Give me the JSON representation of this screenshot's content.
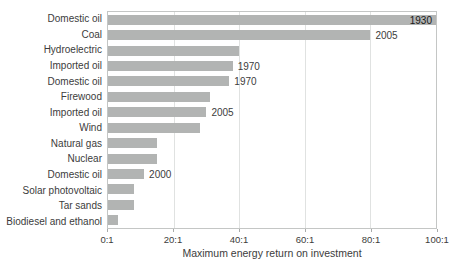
{
  "chart_data": {
    "type": "bar",
    "orientation": "horizontal",
    "title": "",
    "xlabel": "Maximum energy return on investment",
    "ylabel": "",
    "xlim": [
      0,
      100
    ],
    "grid": "vertical",
    "x_ticks": [
      "0:1",
      "20:1",
      "40:1",
      "60:1",
      "80:1",
      "100:1"
    ],
    "x_tick_values": [
      0,
      20,
      40,
      60,
      80,
      100
    ],
    "bars": [
      {
        "label": "Domestic oil",
        "value": 100,
        "year": "1930",
        "year_position": "inside"
      },
      {
        "label": "Coal",
        "value": 80,
        "year": "2005",
        "year_position": "outside"
      },
      {
        "label": "Hydroelectric",
        "value": 40,
        "year": "",
        "year_position": "none"
      },
      {
        "label": "Imported oil",
        "value": 38,
        "year": "1970",
        "year_position": "outside"
      },
      {
        "label": "Domestic oil",
        "value": 37,
        "year": "1970",
        "year_position": "outside"
      },
      {
        "label": "Firewood",
        "value": 31,
        "year": "",
        "year_position": "none"
      },
      {
        "label": "Imported oil",
        "value": 30,
        "year": "2005",
        "year_position": "outside"
      },
      {
        "label": "Wind",
        "value": 28,
        "year": "",
        "year_position": "none"
      },
      {
        "label": "Natural gas",
        "value": 15,
        "year": "",
        "year_position": "none"
      },
      {
        "label": "Nuclear",
        "value": 15,
        "year": "",
        "year_position": "none"
      },
      {
        "label": "Domestic oil",
        "value": 11,
        "year": "2000",
        "year_position": "outside"
      },
      {
        "label": "Solar photovoltaic",
        "value": 8,
        "year": "",
        "year_position": "none"
      },
      {
        "label": "Tar sands",
        "value": 8,
        "year": "",
        "year_position": "none"
      },
      {
        "label": "Biodiesel and ethanol",
        "value": 3,
        "year": "",
        "year_position": "none"
      }
    ],
    "colors": {
      "bar": "#b2b4b3",
      "grid": "#e0e2e1",
      "axis_border": "#c4c6c5",
      "text": "#3c3c3c",
      "year_inside_text": "#1a1a1a",
      "background": "#ffffff"
    },
    "legend": "none"
  }
}
